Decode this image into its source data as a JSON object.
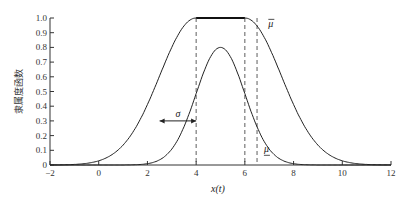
{
  "chart_data": {
    "type": "line",
    "title": "",
    "xlabel": "x(t)",
    "ylabel": "隶属度函数",
    "xlim": [
      -2,
      12
    ],
    "ylim": [
      0,
      1.0
    ],
    "xticks": [
      "-2",
      "0",
      "2",
      "4",
      "6",
      "8",
      "10",
      "12"
    ],
    "yticks": [
      "0",
      "0.1",
      "0.2",
      "0.3",
      "0.4",
      "0.5",
      "0.6",
      "0.7",
      "0.8",
      "0.9",
      "1.0"
    ],
    "grid": false,
    "series": [
      {
        "name": "upper membership (μ̄)",
        "label": "μ̄",
        "description": "Gaussian with flat top between x=4 and x=6, sigma≈1.5",
        "x": [
          0,
          1,
          2,
          2.5,
          3,
          3.5,
          4,
          5,
          6,
          6.5,
          7,
          7.5,
          8,
          9,
          10
        ],
        "y": [
          0.03,
          0.14,
          0.41,
          0.61,
          0.8,
          0.95,
          1.0,
          1.0,
          1.0,
          0.95,
          0.8,
          0.61,
          0.41,
          0.14,
          0.03
        ]
      },
      {
        "name": "lower membership (μ̲)",
        "label": "μ̲",
        "description": "Gaussian scaled to 0.8 centered at x=5, sigma≈1",
        "x": [
          2,
          3,
          3.5,
          4,
          4.5,
          5,
          5.5,
          6,
          6.5,
          7,
          8
        ],
        "y": [
          0.01,
          0.11,
          0.26,
          0.49,
          0.71,
          0.8,
          0.71,
          0.49,
          0.26,
          0.11,
          0.01
        ]
      }
    ],
    "annotations": [
      {
        "text": "σ",
        "type": "double-arrow",
        "from_x": 2.5,
        "to_x": 4,
        "y": 0.3
      },
      {
        "text": "μ̄",
        "x": 6.8,
        "y": 0.95
      },
      {
        "text": "μ̲",
        "x": 6.7,
        "y": 0.1
      },
      {
        "type": "dashed-vline",
        "x": 4
      },
      {
        "type": "dashed-vline",
        "x": 6
      },
      {
        "type": "dashed-vline",
        "x": 6.5
      }
    ]
  },
  "labels": {
    "xlabel": "x(t)",
    "ylabel": "隶属度函数",
    "sigma": "σ",
    "upper": "μ",
    "lower": "μ"
  }
}
